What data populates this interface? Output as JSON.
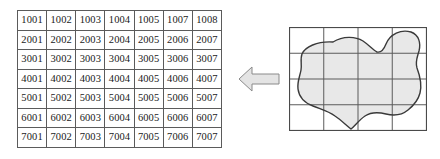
{
  "figure": {
    "background_color": "#ffffff"
  },
  "raster_table": {
    "name": "raster-cell-id-grid",
    "rows": 7,
    "columns": 7,
    "border_color": "#5b5b5b",
    "cell_background": "#ffffff",
    "text_color": "#1a1a1a",
    "cells": [
      [
        "1001",
        "1002",
        "1003",
        "1004",
        "1005",
        "1007",
        "1008"
      ],
      [
        "2001",
        "2002",
        "2003",
        "2004",
        "2005",
        "2006",
        "2007"
      ],
      [
        "3001",
        "3002",
        "3003",
        "3004",
        "3005",
        "3006",
        "3007"
      ],
      [
        "4001",
        "4002",
        "4003",
        "4004",
        "4005",
        "4006",
        "4007"
      ],
      [
        "5001",
        "5002",
        "5003",
        "5004",
        "5005",
        "5006",
        "5007"
      ],
      [
        "6001",
        "6002",
        "6003",
        "6004",
        "6005",
        "6006",
        "6007"
      ],
      [
        "7001",
        "7002",
        "7003",
        "7004",
        "7005",
        "7006",
        "7007"
      ]
    ]
  },
  "arrow": {
    "name": "left-pointing-arrow",
    "direction": "left",
    "fill_color": "#e4e4e4",
    "stroke_color": "#8a8a8a"
  },
  "vector_panel": {
    "name": "vector-polygon-over-grid",
    "grid": {
      "columns": 4,
      "rows": 4,
      "line_color": "#5b5b5b",
      "outer_border_color": "#4a4a4a"
    },
    "polygon": {
      "name": "irregular-region-polygon",
      "fill_color": "#e8e8e8",
      "stroke_color": "#3a3a3a",
      "stroke_width": 1.4
    }
  }
}
